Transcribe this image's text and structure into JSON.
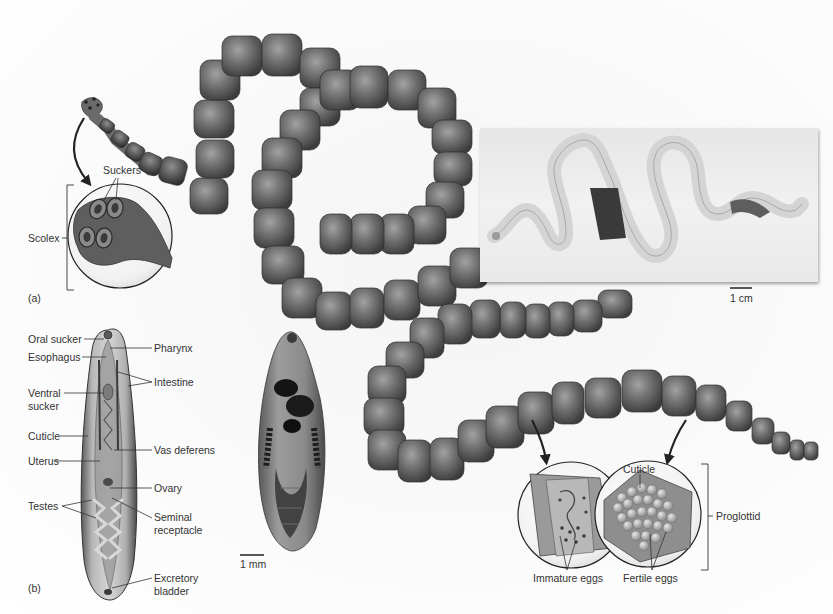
{
  "figure": {
    "panel_a_label": "(a)",
    "panel_b_label": "(b)",
    "grayscale": true
  },
  "panel_a": {
    "labels": {
      "suckers": "Suckers",
      "scolex": "Scolex",
      "cuticle": "Cuticle",
      "proglottid": "Proglottid",
      "immature_eggs": "Immature eggs",
      "fertile_eggs": "Fertile eggs"
    },
    "photo_scale_bar": "1 cm"
  },
  "panel_b": {
    "labels_left": {
      "oral_sucker": "Oral sucker",
      "esophagus": "Esophagus",
      "ventral_sucker_1": "Ventral",
      "ventral_sucker_2": "sucker",
      "cuticle": "Cuticle",
      "uterus": "Uterus",
      "testes": "Testes"
    },
    "labels_right": {
      "pharynx": "Pharynx",
      "intestine": "Intestine",
      "vas_deferens": "Vas deferens",
      "ovary": "Ovary",
      "seminal_receptacle_1": "Seminal",
      "seminal_receptacle_2": "receptacle",
      "excretory_bladder_1": "Excretory",
      "excretory_bladder_2": "bladder"
    },
    "micrograph_scale_bar": "1 mm"
  },
  "colors": {
    "segment_fill": "#6e6e6e",
    "segment_dark": "#3e3e3e",
    "segment_light": "#9a9a9a",
    "label_text": "#333333",
    "leader_line": "#333333"
  }
}
